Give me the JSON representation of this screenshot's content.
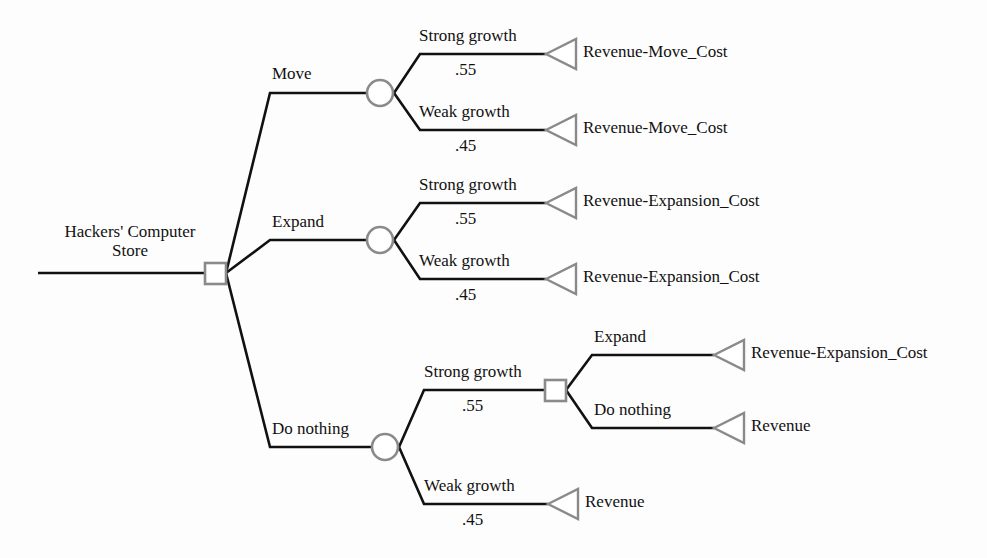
{
  "diagram": {
    "type": "decision-tree",
    "root": {
      "label_line1": "Hackers' Computer",
      "label_line2": "Store",
      "node_type": "decision-square"
    },
    "colors": {
      "line": "#111111",
      "node_outline": "#8a8a8a",
      "node_fill": "#ffffff",
      "text": "#111111",
      "background": "#fdfdfd"
    },
    "branches": {
      "move": {
        "label": "Move",
        "chance_node": "chance-circle",
        "outcomes": [
          {
            "label": "Strong growth",
            "probability": ".55",
            "payoff": "Revenue-Move_Cost"
          },
          {
            "label": "Weak growth",
            "probability": ".45",
            "payoff": "Revenue-Move_Cost"
          }
        ]
      },
      "expand": {
        "label": "Expand",
        "chance_node": "chance-circle",
        "outcomes": [
          {
            "label": "Strong growth",
            "probability": ".55",
            "payoff": "Revenue-Expansion_Cost"
          },
          {
            "label": "Weak growth",
            "probability": ".45",
            "payoff": "Revenue-Expansion_Cost"
          }
        ]
      },
      "do_nothing": {
        "label": "Do nothing",
        "chance_node": "chance-circle",
        "outcomes": [
          {
            "label": "Strong growth",
            "probability": ".55",
            "payoff": null,
            "sub_decision": {
              "node_type": "decision-square",
              "options": [
                {
                  "label": "Expand",
                  "payoff": "Revenue-Expansion_Cost"
                },
                {
                  "label": "Do nothing",
                  "payoff": "Revenue"
                }
              ]
            }
          },
          {
            "label": "Weak growth",
            "probability": ".45",
            "payoff": "Revenue"
          }
        ]
      }
    }
  }
}
